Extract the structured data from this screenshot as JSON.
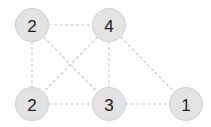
{
  "graph": {
    "nodes": [
      {
        "id": "a",
        "label": "2"
      },
      {
        "id": "b",
        "label": "4"
      },
      {
        "id": "c",
        "label": "2"
      },
      {
        "id": "d",
        "label": "3"
      },
      {
        "id": "e",
        "label": "1"
      }
    ],
    "edges": [
      {
        "from": "a",
        "to": "b"
      },
      {
        "from": "a",
        "to": "c"
      },
      {
        "from": "a",
        "to": "d"
      },
      {
        "from": "b",
        "to": "c"
      },
      {
        "from": "b",
        "to": "d"
      },
      {
        "from": "b",
        "to": "e"
      },
      {
        "from": "c",
        "to": "d"
      },
      {
        "from": "d",
        "to": "e"
      }
    ],
    "edge_style": "dashed",
    "colors": {
      "node_fill": "#e3e3e3",
      "node_stroke": "#cfcfcf",
      "edge": "#c8c8c8",
      "label": "#1a1a1a"
    }
  }
}
